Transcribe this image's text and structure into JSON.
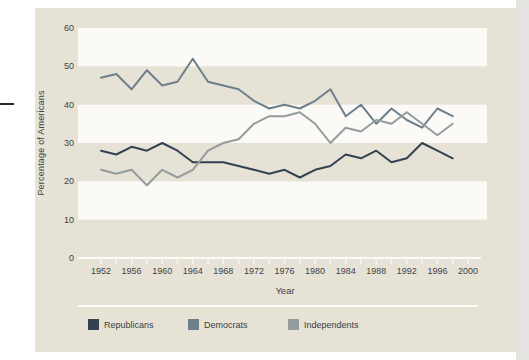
{
  "figure": {
    "ylabel": "Percentage of Americans",
    "xlabel": "Year",
    "colors": {
      "panel": "#e6e2d6",
      "band": "#fbfaf6",
      "axis": "#fbfaf6",
      "text": "#3e4347"
    }
  },
  "chart_data": {
    "type": "line",
    "x": [
      1952,
      1954,
      1956,
      1958,
      1960,
      1962,
      1964,
      1966,
      1968,
      1970,
      1972,
      1974,
      1976,
      1978,
      1980,
      1982,
      1984,
      1986,
      1988,
      1990,
      1992,
      1994,
      1996,
      1998
    ],
    "series": [
      {
        "name": "Republicans",
        "color": "#334251",
        "values": [
          28,
          27,
          29,
          28,
          30,
          28,
          25,
          25,
          25,
          24,
          23,
          22,
          23,
          21,
          23,
          24,
          27,
          26,
          28,
          25,
          26,
          30,
          28,
          26
        ]
      },
      {
        "name": "Democrats",
        "color": "#6d7f8b",
        "values": [
          47,
          48,
          44,
          49,
          45,
          46,
          52,
          46,
          45,
          44,
          41,
          39,
          40,
          39,
          41,
          44,
          37,
          40,
          35,
          39,
          36,
          34,
          39,
          37
        ]
      },
      {
        "name": "Independents",
        "color": "#949c9e",
        "values": [
          23,
          22,
          23,
          19,
          23,
          21,
          23,
          28,
          30,
          31,
          35,
          37,
          37,
          38,
          35,
          30,
          34,
          33,
          36,
          35,
          38,
          35,
          32,
          35
        ]
      }
    ],
    "xticks": [
      1952,
      1956,
      1960,
      1964,
      1968,
      1972,
      1976,
      1980,
      1984,
      1988,
      1992,
      1996,
      2000
    ],
    "yticks": [
      0,
      10,
      20,
      30,
      40,
      50,
      60
    ],
    "ylim": [
      0,
      60
    ],
    "xlim": [
      1949,
      2002
    ],
    "bands": [
      [
        10,
        20
      ],
      [
        30,
        40
      ],
      [
        50,
        60
      ]
    ],
    "grid": "white-horizontal-bands",
    "legend_position": "bottom",
    "title": "",
    "xlabel": "Year",
    "ylabel": "Percentage of Americans"
  }
}
